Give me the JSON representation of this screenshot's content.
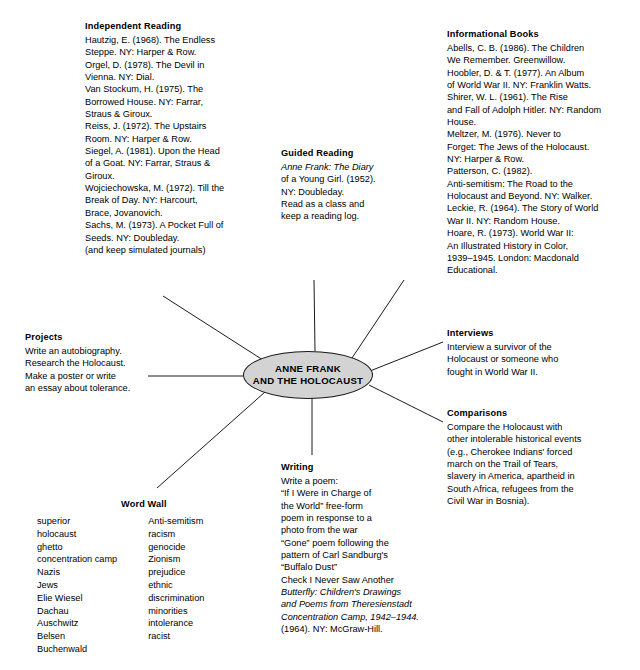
{
  "diagram": {
    "type": "mind-map",
    "center": {
      "line1": "ANNE FRANK",
      "line2": "AND THE HOLOCAUST",
      "fill_color": "#d3d3d3",
      "border_color": "#1a1a1a"
    },
    "branches": [
      {
        "id": "independent-reading",
        "title": "Independent Reading",
        "lines": [
          "Hautzig, E. (1968). The Endless",
          "Steppe. NY: Harper & Row.",
          "Orgel, D. (1978). The Devil in",
          "Vienna. NY: Dial.",
          "Van Stockum, H. (1975). The",
          "Borrowed House. NY: Farrar,",
          "Straus & Giroux.",
          "Reiss, J. (1972). The Upstairs",
          "Room. NY: Harper & Row.",
          "Siegel, A. (1981). Upon the Head",
          "of a Goat. NY: Farrar, Straus &",
          "Giroux.",
          "Wojciechowska, M. (1972). Till the",
          "Break of Day. NY: Harcourt,",
          "Brace, Jovanovich.",
          "Sachs, M. (1973). A Pocket Full of",
          "Seeds. NY: Doubleday.",
          "(and keep simulated journals)"
        ]
      },
      {
        "id": "guided-reading",
        "title": "Guided Reading",
        "lines": [
          "Anne Frank: The Diary",
          "of a Young Girl. (1952).",
          "NY: Doubleday.",
          "Read as a class and",
          "keep a reading log."
        ]
      },
      {
        "id": "informational-books",
        "title": "Informational Books",
        "lines": [
          "Abells, C. B. (1986). The Children",
          "We Remember. Greenwillow.",
          "Hoobler, D. & T. (1977). An Album",
          "of World War II.  NY: Franklin Watts.",
          "Shirer, W. L. (1961). The Rise",
          "and Fall of Adolph Hitler. NY: Random",
          "House.",
          "Meltzer, M. (1976). Never to",
          "Forget: The Jews of the Holocaust.",
          "NY: Harper & Row.",
          "Patterson, C. (1982).",
          "Anti-semitism:  The Road to the",
          "Holocaust and Beyond.  NY: Walker.",
          "Leckie, R. (1964). The Story of World",
          "War II.  NY: Random House.",
          "Hoare, R. (1973). World War II:",
          "An Illustrated History in Color,",
          "1939–1945. London: Macdonald",
          "Educational."
        ]
      },
      {
        "id": "projects",
        "title": "Projects",
        "lines": [
          "Write an autobiography.",
          "Research the Holocaust.",
          "Make a poster or write",
          "an essay about tolerance."
        ]
      },
      {
        "id": "interviews",
        "title": "Interviews",
        "lines": [
          "Interview a survivor of the",
          "Holocaust or someone who",
          "fought in World War II."
        ]
      },
      {
        "id": "comparisons",
        "title": "Comparisons",
        "lines": [
          "Compare the Holocaust with",
          "other intolerable historical events",
          "(e.g., Cherokee Indians' forced",
          "march on the Trail of Tears,",
          "slavery in America, apartheid in",
          "South Africa, refugees from the",
          "Civil War in Bosnia)."
        ]
      },
      {
        "id": "writing",
        "title": "Writing",
        "lines": [
          "Write a poem:",
          "“If I Were in Charge of",
          "the World” free-form",
          "poem in response to a",
          "photo from the war",
          "“Gone” poem following the",
          "pattern of Carl Sandburg's",
          "“Buffalo Dust”",
          "Check I Never Saw Another",
          "Butterfly:  Children's Drawings",
          "and Poems from Theresienstadt",
          "Concentration Camp, 1942–1944.",
          "(1964). NY: McGraw-Hill."
        ]
      },
      {
        "id": "word-wall",
        "title": "Word Wall",
        "column_left": [
          "superior",
          "holocaust",
          "ghetto",
          "concentration camp",
          "Nazis",
          "Jews",
          "Elie Wiesel",
          "Dachau",
          "Auschwitz",
          "Belsen",
          "Buchenwald"
        ],
        "column_right": [
          "Anti-semitism",
          "racism",
          "genocide",
          "Zionism",
          "prejudice",
          "ethnic",
          "discrimination",
          "minorities",
          "intolerance",
          "racist"
        ]
      }
    ]
  }
}
